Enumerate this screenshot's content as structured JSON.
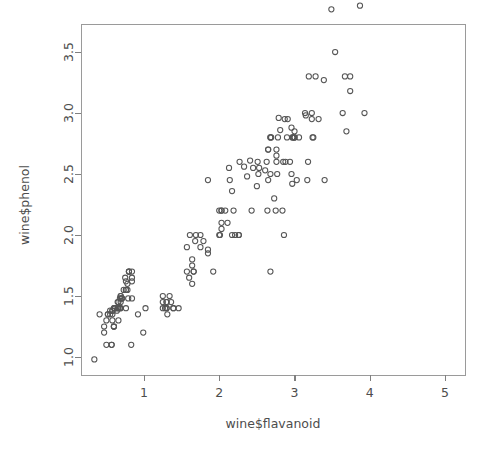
{
  "chart_data": {
    "type": "scatter",
    "title": "",
    "xlabel": "wine$flavanoid",
    "ylabel": "wine$phenol",
    "xlim": [
      0.2,
      5.3
    ],
    "ylim": [
      0.92,
      3.95
    ],
    "xticks": [
      1,
      2,
      3,
      4,
      5
    ],
    "xtick_labels": [
      "1",
      "2",
      "3",
      "4",
      "5"
    ],
    "yticks": [
      1.0,
      1.5,
      2.0,
      2.5,
      3.0,
      3.5
    ],
    "ytick_labels": [
      "1.0",
      "1.5",
      "2.0",
      "2.5",
      "3.0",
      "3.5"
    ],
    "grid": false,
    "legend": null,
    "marker": "open-circle",
    "marker_color": "#555555",
    "background": "#ffffff",
    "n_points": 178,
    "series": [
      {
        "name": "wine",
        "x": [
          3.06,
          2.76,
          3.24,
          3.49,
          2.69,
          3.39,
          2.52,
          2.51,
          2.98,
          3.15,
          3.32,
          2.43,
          2.76,
          3.69,
          3.64,
          2.91,
          3.14,
          3.4,
          3.93,
          3.03,
          3.17,
          2.41,
          2.88,
          2.37,
          2.61,
          2.68,
          2.94,
          2.19,
          2.97,
          2.33,
          3.25,
          3.19,
          2.96,
          2.81,
          2.77,
          3.74,
          3.23,
          3.67,
          0.99,
          3.87,
          3.54,
          2.99,
          3.74,
          2.79,
          2.9,
          2.78,
          2.85,
          2.73,
          3.0,
          3.23,
          2.13,
          2.65,
          2.76,
          3.28,
          2.84,
          2.87,
          3.0,
          2.96,
          2.63,
          2.5,
          2.97,
          2.65,
          1.02,
          2.86,
          2.14,
          2.21,
          2.75,
          1.3,
          2.68,
          2.64,
          1.64,
          1.57,
          2.03,
          1.6,
          1.85,
          2.0,
          2.03,
          0.57,
          2.11,
          3.18,
          1.69,
          1.61,
          2.0,
          1.85,
          3.0,
          2.26,
          1.64,
          2.26,
          1.92,
          2.17,
          1.79,
          0.83,
          2.08,
          1.34,
          2.45,
          0.57,
          1.25,
          1.46,
          1.75,
          1.68,
          1.3,
          2.03,
          1.28,
          2.68,
          1.66,
          2.17,
          2.27,
          2.03,
          2.01,
          1.64,
          1.3,
          1.75,
          2.65,
          1.3,
          2.68,
          1.66,
          1.36,
          1.25,
          0.6,
          1.25,
          1.85,
          0.58,
          2.53,
          1.31,
          1.39,
          0.92,
          0.5,
          0.6,
          1.39,
          1.57,
          0.66,
          0.47,
          0.84,
          0.6,
          0.69,
          0.79,
          0.68,
          0.84,
          0.8,
          0.58,
          0.76,
          0.84,
          0.69,
          0.78,
          0.55,
          0.34,
          0.65,
          0.76,
          0.78,
          0.58,
          0.52,
          0.8,
          0.75,
          0.69,
          0.68,
          0.73,
          0.71,
          0.61,
          0.41,
          0.76,
          0.66,
          0.47,
          0.58,
          0.6,
          0.5,
          0.52,
          0.8,
          0.7,
          0.61,
          0.69,
          0.65,
          0.68,
          0.76,
          0.84,
          0.55,
          0.65,
          0.66,
          0.64,
          0.7,
          0.61
        ],
        "y": [
          2.8,
          2.65,
          2.8,
          3.85,
          2.8,
          3.27,
          2.5,
          2.6,
          2.8,
          2.98,
          2.95,
          2.2,
          2.6,
          2.85,
          3.0,
          2.95,
          3.0,
          2.45,
          3.0,
          2.45,
          2.45,
          2.61,
          2.6,
          2.48,
          2.53,
          2.5,
          2.6,
          2.2,
          2.8,
          2.56,
          2.8,
          3.3,
          2.88,
          2.86,
          2.5,
          3.18,
          2.95,
          3.3,
          1.2,
          3.88,
          3.5,
          2.8,
          3.3,
          2.96,
          2.8,
          2.8,
          2.6,
          2.3,
          2.85,
          3.0,
          2.55,
          2.45,
          2.7,
          3.3,
          2.2,
          2.95,
          2.8,
          2.5,
          2.6,
          2.4,
          2.42,
          2.7,
          1.4,
          2.0,
          2.45,
          2.0,
          2.2,
          1.4,
          1.7,
          2.2,
          1.75,
          1.9,
          2.2,
          1.65,
          2.45,
          2.0,
          2.1,
          1.1,
          2.1,
          2.6,
          2.0,
          2.0,
          2.2,
          1.88,
          2.8,
          2.0,
          1.8,
          2.0,
          1.7,
          2.36,
          1.95,
          1.1,
          2.2,
          1.5,
          2.55,
          1.1,
          1.5,
          1.4,
          2.0,
          1.95,
          1.45,
          2.05,
          1.4,
          2.8,
          1.7,
          2.0,
          2.6,
          2.2,
          2.0,
          1.6,
          1.45,
          1.9,
          2.7,
          1.4,
          2.8,
          1.7,
          1.45,
          1.4,
          1.25,
          1.45,
          1.85,
          1.3,
          2.55,
          1.35,
          1.4,
          1.35,
          1.1,
          1.25,
          1.4,
          1.7,
          1.3,
          1.2,
          1.48,
          1.25,
          1.5,
          1.48,
          1.4,
          1.65,
          1.7,
          1.35,
          1.4,
          1.62,
          1.5,
          1.55,
          1.38,
          0.98,
          1.4,
          1.55,
          1.6,
          1.38,
          1.35,
          1.7,
          1.65,
          1.4,
          1.4,
          1.55,
          1.48,
          1.4,
          1.35,
          1.62,
          1.45,
          1.25,
          1.38,
          1.4,
          1.3,
          1.35,
          1.7,
          1.48,
          1.4,
          1.45,
          1.4,
          1.48,
          1.55,
          1.7,
          1.35,
          1.45,
          1.4,
          1.38,
          1.48,
          1.4
        ]
      }
    ]
  },
  "figure": {
    "plot_area": {
      "left": 81,
      "top": 24,
      "right": 465,
      "bottom": 375
    },
    "axis_color": "#808080",
    "text_color": "#4d4d4d"
  }
}
